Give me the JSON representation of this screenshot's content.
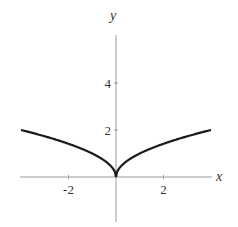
{
  "chart_data": {
    "type": "line",
    "title": "",
    "xlabel": "x",
    "ylabel": "y",
    "function": "y = sqrt(|x|)",
    "xlim": [
      -4,
      4
    ],
    "ylim": [
      -2,
      6
    ],
    "x_ticks": [
      -2,
      2
    ],
    "y_ticks": [
      2,
      4
    ],
    "x_tick_labels": [
      "-2",
      "2"
    ],
    "y_tick_labels": [
      "2",
      "4"
    ],
    "grid": false,
    "legend": null,
    "series": [
      {
        "name": "y = sqrt(|x|)",
        "x": [
          -4,
          -3,
          -2,
          -1,
          -0.5,
          -0.1,
          0,
          0.1,
          0.5,
          1,
          2,
          3,
          4
        ],
        "y": [
          2,
          1.732,
          1.414,
          1,
          0.707,
          0.316,
          0,
          0.316,
          0.707,
          1,
          1.414,
          1.732,
          2
        ],
        "color": "#1a1a1a"
      }
    ]
  }
}
